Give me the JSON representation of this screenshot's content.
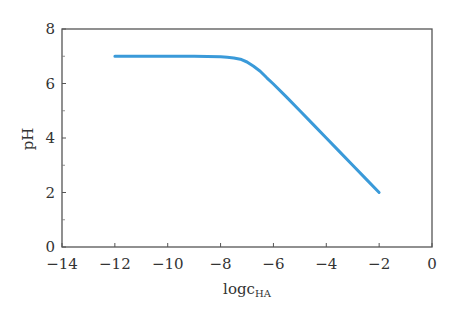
{
  "chart_data": {
    "type": "line",
    "title": "",
    "xlabel": "logc",
    "xlabel_subscript": "HA",
    "ylabel": "pH",
    "xlim": [
      -14,
      0
    ],
    "ylim": [
      0,
      8
    ],
    "xticks": [
      -14,
      -12,
      -10,
      -8,
      -6,
      -4,
      -2,
      0
    ],
    "xtick_labels": [
      "−14",
      "−12",
      "−10",
      "−8",
      "−6",
      "−4",
      "−2",
      "0"
    ],
    "yticks": [
      0,
      2,
      4,
      6,
      8
    ],
    "ytick_labels": [
      "0",
      "2",
      "4",
      "6",
      "8"
    ],
    "y_minor_ticks": [
      1,
      3,
      5,
      7
    ],
    "grid": false,
    "legend": null,
    "series": [
      {
        "name": "pH vs logc",
        "color": "#3a9ad9",
        "x": [
          -12,
          -11,
          -10,
          -9,
          -8.5,
          -8,
          -7.75,
          -7.5,
          -7.25,
          -7,
          -6.75,
          -6.5,
          -6.25,
          -6,
          -5.5,
          -5,
          -4.5,
          -4,
          -3.5,
          -3,
          -2.5,
          -2
        ],
        "values": [
          7.0,
          7.0,
          7.0,
          6.998,
          6.993,
          6.979,
          6.963,
          6.936,
          6.893,
          6.79,
          6.63,
          6.45,
          6.21,
          5.98,
          5.5,
          5.0,
          4.5,
          4.0,
          3.5,
          3.0,
          2.5,
          2.0
        ]
      }
    ]
  }
}
